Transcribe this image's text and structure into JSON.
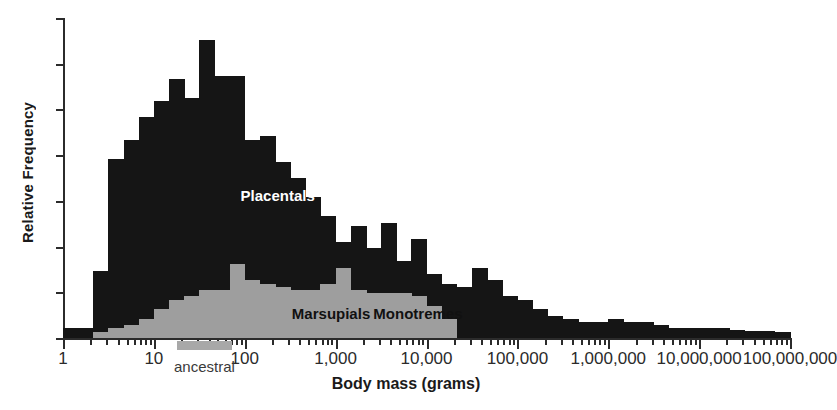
{
  "chart_data": {
    "type": "bar",
    "title": "",
    "xlabel": "Body mass (grams)",
    "ylabel": "Relative Frequency",
    "xscale": "log",
    "xlim": [
      1,
      100000000
    ],
    "ylim": [
      0,
      1
    ],
    "grid": false,
    "legend_position": "inside-plot-annotations",
    "xtick_labels": [
      "1",
      "10",
      "100",
      "1,000",
      "10,000",
      "100,000",
      "1,000,000",
      "10,000,000",
      "100,000,000"
    ],
    "xtick_values": [
      1,
      10,
      100,
      1000,
      10000,
      100000,
      1000000,
      10000000,
      100000000
    ],
    "ytick_count": 8,
    "ytick_labels": [],
    "annotations": [
      {
        "text": "Placentals",
        "x": 90,
        "y": 0.42,
        "color": "#ffffff"
      },
      {
        "text": "Marsupials",
        "x": 330,
        "y": 0.05,
        "color": "#111111"
      },
      {
        "text": "Monotremes",
        "x": 2600,
        "y": 0.05,
        "color": "#111111"
      },
      {
        "text": "ancestral",
        "x": 35,
        "y": -0.12,
        "color": "#3a3a3a"
      }
    ],
    "ancestral_marker": {
      "label": "ancestral",
      "xmin": 18,
      "xmax": 72
    },
    "colors": {
      "placentals": "#151515",
      "marsupials": "#9e9e9e",
      "axis": "#2b2b2b",
      "background": "#ffffff"
    },
    "bin_width_decades": 0.1667,
    "series": [
      {
        "name": "Placentals",
        "color": "#151515",
        "bin_left": [
          1.0,
          1.47,
          2.15,
          3.16,
          4.64,
          6.81,
          10.0,
          14.7,
          21.5,
          31.6,
          46.4,
          68.1,
          100,
          147,
          215,
          316,
          464,
          681,
          1000,
          1470,
          2150,
          3160,
          4640,
          6810,
          10000,
          14700,
          21500,
          31600,
          46400,
          68100,
          100000,
          147000,
          215000,
          316000,
          464000,
          681000,
          1000000,
          1470000,
          2150000,
          3160000,
          4640000,
          6810000,
          10000000,
          14700000,
          21500000,
          31600000,
          46400000,
          68100000
        ],
        "values": [
          0.03,
          0.03,
          0.21,
          0.56,
          0.62,
          0.69,
          0.74,
          0.81,
          0.75,
          0.93,
          0.82,
          0.82,
          0.62,
          0.63,
          0.55,
          0.5,
          0.44,
          0.38,
          0.3,
          0.35,
          0.28,
          0.36,
          0.24,
          0.31,
          0.2,
          0.17,
          0.16,
          0.22,
          0.18,
          0.13,
          0.12,
          0.09,
          0.07,
          0.06,
          0.05,
          0.05,
          0.06,
          0.05,
          0.05,
          0.04,
          0.03,
          0.03,
          0.03,
          0.03,
          0.025,
          0.022,
          0.022,
          0.02
        ]
      },
      {
        "name": "Marsupials and Monotremes",
        "color": "#9e9e9e",
        "bin_left": [
          2.15,
          3.16,
          4.64,
          6.81,
          10.0,
          14.7,
          21.5,
          31.6,
          46.4,
          68.1,
          100,
          147,
          215,
          316,
          464,
          681,
          1000,
          1470,
          2150,
          3160,
          4640,
          6810,
          10000,
          14700
        ],
        "values": [
          0.02,
          0.03,
          0.04,
          0.06,
          0.09,
          0.12,
          0.13,
          0.15,
          0.15,
          0.23,
          0.18,
          0.17,
          0.16,
          0.15,
          0.15,
          0.17,
          0.22,
          0.15,
          0.14,
          0.14,
          0.14,
          0.13,
          0.1,
          0.06
        ]
      }
    ]
  }
}
